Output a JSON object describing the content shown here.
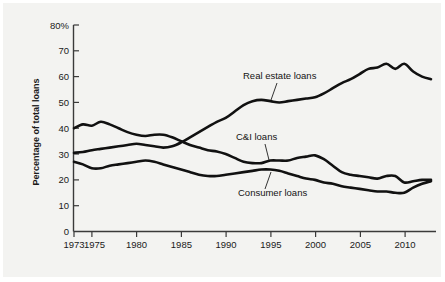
{
  "chart_data": {
    "type": "line",
    "title": "",
    "xlabel": "",
    "ylabel": "Percentage of total loans",
    "xlim": [
      1973,
      2013
    ],
    "ylim": [
      0,
      80
    ],
    "grid": false,
    "legend_position": "inline-annotations",
    "y_ticks": [
      0,
      10,
      20,
      30,
      40,
      50,
      60,
      70,
      80
    ],
    "y_tick_labels": [
      "0",
      "10",
      "20",
      "30",
      "40",
      "50",
      "60",
      "70",
      "80%"
    ],
    "x_ticks": [
      1973,
      1975,
      1980,
      1985,
      1990,
      1995,
      2000,
      2005,
      2010
    ],
    "x_tick_labels": [
      "1973",
      "1975",
      "1980",
      "1985",
      "1990",
      "1995",
      "2000",
      "2005",
      "2010"
    ],
    "x": [
      1973,
      1974,
      1975,
      1976,
      1977,
      1978,
      1979,
      1980,
      1981,
      1982,
      1983,
      1984,
      1985,
      1986,
      1987,
      1988,
      1989,
      1990,
      1991,
      1992,
      1993,
      1994,
      1995,
      1996,
      1997,
      1998,
      1999,
      2000,
      2001,
      2002,
      2003,
      2004,
      2005,
      2006,
      2007,
      2008,
      2009,
      2010,
      2011,
      2012,
      2013
    ],
    "series": [
      {
        "name": "Real estate loans",
        "label": "Real estate loans",
        "values": [
          30.5,
          30.8,
          31.5,
          32.0,
          32.5,
          33.0,
          33.5,
          34.0,
          33.5,
          33.0,
          32.5,
          33.0,
          34.5,
          36.5,
          38.5,
          40.5,
          42.5,
          44.0,
          46.5,
          49.0,
          50.5,
          51.0,
          50.5,
          50.0,
          50.5,
          51.0,
          51.5,
          52.0,
          53.5,
          55.5,
          57.5,
          59.0,
          61.0,
          63.0,
          63.5,
          65.0,
          63.0,
          65.0,
          62.0,
          60.0,
          59.0
        ]
      },
      {
        "name": "C&I loans",
        "label": "C&I loans",
        "values": [
          40.0,
          41.5,
          41.0,
          42.5,
          41.5,
          40.0,
          38.5,
          37.5,
          37.0,
          37.5,
          37.5,
          36.5,
          35.0,
          33.5,
          32.5,
          31.5,
          31.0,
          30.0,
          28.5,
          27.0,
          26.5,
          26.5,
          27.5,
          27.5,
          27.5,
          28.5,
          29.0,
          29.5,
          28.0,
          25.5,
          23.0,
          22.0,
          21.5,
          21.0,
          20.5,
          21.5,
          21.5,
          19.0,
          19.5,
          20.0,
          20.0
        ]
      },
      {
        "name": "Consumer loans",
        "label": "Consumer loans",
        "values": [
          27.0,
          26.0,
          24.5,
          24.5,
          25.5,
          26.0,
          26.5,
          27.0,
          27.5,
          27.0,
          26.0,
          25.0,
          24.0,
          23.0,
          22.0,
          21.5,
          21.5,
          22.0,
          22.5,
          23.0,
          23.5,
          24.0,
          24.0,
          23.5,
          22.5,
          21.5,
          20.5,
          20.0,
          19.0,
          18.5,
          17.5,
          17.0,
          16.5,
          16.0,
          15.5,
          15.5,
          15.0,
          15.0,
          17.0,
          18.5,
          19.5
        ]
      }
    ],
    "annotations": [
      {
        "text": "Real estate loans",
        "series": "Real estate loans"
      },
      {
        "text": "C&I loans",
        "series": "C&I loans"
      },
      {
        "text": "Consumer loans",
        "series": "Consumer loans"
      }
    ]
  }
}
